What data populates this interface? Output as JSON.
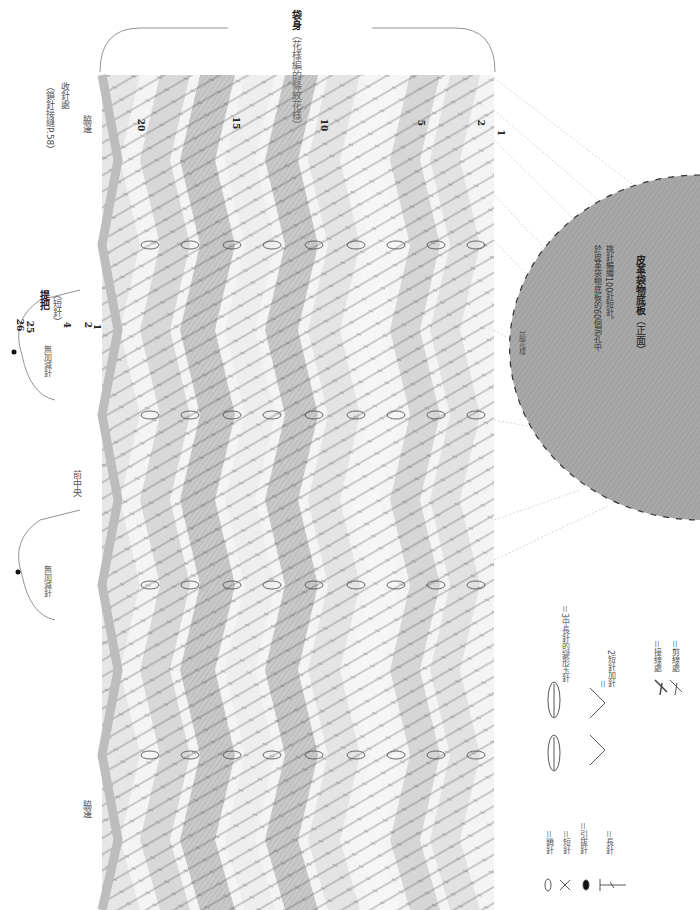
{
  "title": {
    "main": "袋身",
    "sub": "（花樣編的條紋花樣）"
  },
  "labels": {
    "finish": "收針處",
    "finish_note": "（鎖針接縫P.58）",
    "side_edge_top": "脇邊",
    "side_edge_bottom": "脇邊",
    "front_center": "前中央",
    "handle_title": "提把",
    "handle_sub": "（短針）",
    "no_inc_dec_1": "無加減針",
    "no_inc_dec_2": "無加減針",
    "one_repeat": "1組花樣"
  },
  "row_numbers": [
    "20",
    "15",
    "10",
    "5",
    "2",
    "1"
  ],
  "handle_rows": {
    "r26": "26",
    "r25": "25",
    "r4": "4",
    "r2": "2",
    "r1": "1"
  },
  "base": {
    "title": "皮革袋物底板",
    "title_suffix": "（正面）",
    "note_line1": "於皮革袋物底板的60個洞孔中",
    "note_line2": "挑針編織100針短針。",
    "color": "#a6a6a6"
  },
  "legend": {
    "chain": "＝鎖針",
    "single": "＝短針",
    "slip": "＝引拔針",
    "double": "＝長針",
    "bobble": "＝3中長針的變形玉針",
    "increase_eq": "＝",
    "increase": "2短針加針",
    "join": "＝接線處",
    "cut": "＝剪線處"
  },
  "colors": {
    "stripe_light": "#f2f2f2",
    "stripe_mid": "#dcdcdc",
    "stripe_dark": "#c4c4c4",
    "edge_band": "#bdbdbd",
    "ink": "#333333"
  }
}
